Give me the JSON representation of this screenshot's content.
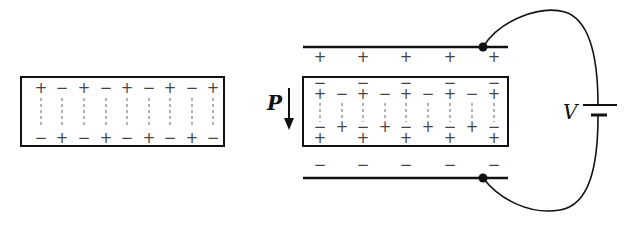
{
  "figure": {
    "left_panel": {
      "description": "Polarized dielectric slab in isolation",
      "top_row_signs": [
        "+",
        "−",
        "+",
        "−",
        "+",
        "−",
        "+",
        "−",
        "+"
      ],
      "bottom_row_signs": [
        "−",
        "+",
        "−",
        "+",
        "−",
        "+",
        "−",
        "+",
        "−"
      ]
    },
    "right_panel": {
      "description": "Polarized slab between capacitor plates connected to battery",
      "polarization_label": "P",
      "voltage_label": "V",
      "top_plate_signs": [
        "+",
        "+",
        "+",
        "+",
        "+"
      ],
      "bottom_plate_signs": [
        "−",
        "−",
        "−",
        "−",
        "−"
      ],
      "slab_top_row_signs": [
        "+",
        "−",
        "+",
        "−",
        "+",
        "−",
        "+",
        "−",
        "+"
      ],
      "slab_top_overbars": [
        "−",
        "",
        "−",
        "",
        "−",
        "",
        "−",
        "",
        "−"
      ],
      "slab_bottom_row_signs": [
        "−",
        "+",
        "−",
        "+",
        "−",
        "+",
        "−",
        "+",
        "−"
      ],
      "slab_bottom_extra_signs": [
        "+",
        "",
        "+",
        "",
        "+",
        "",
        "+",
        "",
        "+"
      ]
    },
    "colors": {
      "line": "#111111",
      "sign": "#444444",
      "dash": "#666666"
    }
  }
}
